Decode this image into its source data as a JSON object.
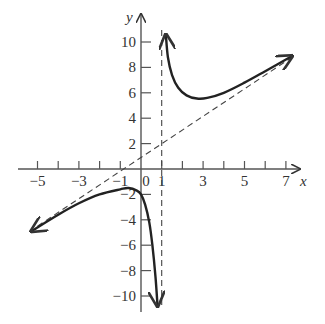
{
  "chart_data": {
    "type": "line",
    "title": "",
    "xlabel": "x",
    "ylabel": "y",
    "xlim": [
      -5.5,
      7.8
    ],
    "ylim": [
      -11,
      11
    ],
    "x_ticks": [
      -5,
      -4,
      -3,
      -2,
      -1,
      0,
      1,
      2,
      3,
      4,
      5,
      6,
      7
    ],
    "x_tick_labels": [
      {
        "v": -5,
        "t": "−5"
      },
      {
        "v": -3,
        "t": "−3"
      },
      {
        "v": -1,
        "t": "−1"
      },
      {
        "v": 0,
        "t": "0"
      },
      {
        "v": 1,
        "t": "1"
      },
      {
        "v": 3,
        "t": "3"
      },
      {
        "v": 5,
        "t": "5"
      },
      {
        "v": 7,
        "t": "7"
      }
    ],
    "y_ticks": [
      -10,
      -8,
      -6,
      -4,
      -2,
      2,
      4,
      6,
      8,
      10
    ],
    "y_tick_labels": [
      {
        "v": 10,
        "t": "10"
      },
      {
        "v": 8,
        "t": "8"
      },
      {
        "v": 6,
        "t": "6"
      },
      {
        "v": 4,
        "t": "4"
      },
      {
        "v": 2,
        "t": "2"
      },
      {
        "v": -2,
        "t": "−2"
      },
      {
        "v": -4,
        "t": "−4"
      },
      {
        "v": -6,
        "t": "−6"
      },
      {
        "v": -8,
        "t": "−8"
      },
      {
        "v": -10,
        "t": "−10"
      }
    ],
    "grid": false,
    "asymptotes": {
      "vertical": {
        "x": 1,
        "style": "dashed"
      },
      "oblique": {
        "points": [
          [
            -5,
            -4.5
          ],
          [
            7.3,
            8.8
          ]
        ],
        "style": "dashed"
      }
    },
    "series": [
      {
        "name": "left-branch",
        "points": [
          [
            -5.3,
            -4.9
          ],
          [
            -4,
            -3.6
          ],
          [
            -3,
            -2.7
          ],
          [
            -2,
            -2.0
          ],
          [
            -1,
            -1.6
          ],
          [
            -0.6,
            -1.5
          ],
          [
            -0.2,
            -1.7
          ],
          [
            0,
            -2.0
          ],
          [
            0.2,
            -2.8
          ],
          [
            0.4,
            -4.2
          ],
          [
            0.55,
            -6.0
          ],
          [
            0.7,
            -8.5
          ],
          [
            0.8,
            -10.8
          ]
        ]
      },
      {
        "name": "right-branch",
        "points": [
          [
            1.2,
            10.6
          ],
          [
            1.3,
            8.8
          ],
          [
            1.5,
            7.4
          ],
          [
            1.8,
            6.4
          ],
          [
            2.2,
            5.8
          ],
          [
            2.7,
            5.55
          ],
          [
            3.2,
            5.6
          ],
          [
            4,
            6.0
          ],
          [
            5,
            6.8
          ],
          [
            6,
            7.7
          ],
          [
            7.3,
            8.9
          ]
        ]
      }
    ]
  }
}
